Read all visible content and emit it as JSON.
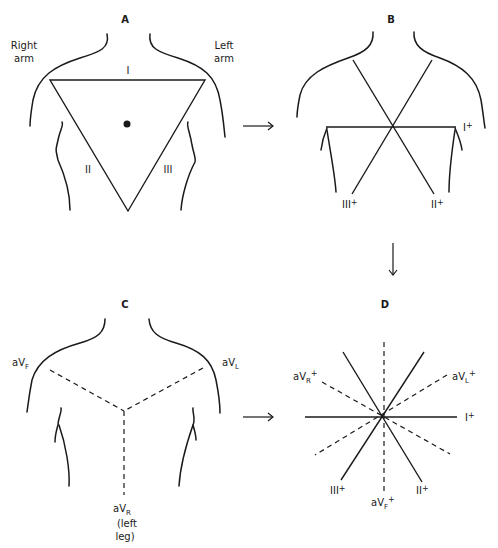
{
  "figure": {
    "panels": {
      "A": {
        "label": "A",
        "right_arm_line1": "Right",
        "right_arm_line2": "arm",
        "left_arm_line1": "Left",
        "left_arm_line2": "arm",
        "lead_I": "I",
        "lead_II": "II",
        "lead_III": "III"
      },
      "B": {
        "label": "B",
        "lead_I": "I",
        "lead_II": "II",
        "lead_III": "III",
        "plus": "+"
      },
      "C": {
        "label": "C",
        "aVF_base": "aV",
        "aVF_sub": "F",
        "aVL_base": "aV",
        "aVL_sub": "L",
        "aVR_base": "aV",
        "aVR_sub": "R",
        "note_line1": "(left",
        "note_line2": "leg)"
      },
      "D": {
        "label": "D",
        "lead_I": "I",
        "lead_II": "II",
        "lead_III": "III",
        "aVR_base": "aV",
        "aVR_sub": "R",
        "aVL_base": "aV",
        "aVL_sub": "L",
        "aVF_base": "aV",
        "aVF_sub": "F",
        "plus": "+"
      }
    },
    "colors": {
      "ink": "#1a1a1a",
      "background": "#ffffff"
    }
  }
}
